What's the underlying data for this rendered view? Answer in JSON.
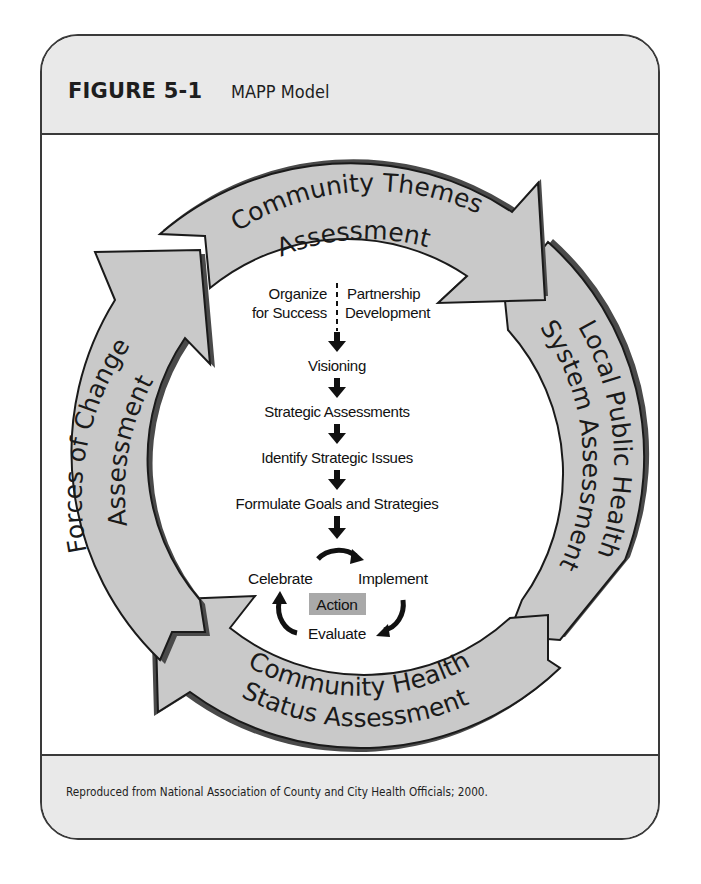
{
  "header": {
    "figure_number": "FIGURE 5-1",
    "figure_title": "MAPP Model"
  },
  "ring": {
    "top": {
      "line1": "Community Themes",
      "line2": "Assessment"
    },
    "right": {
      "line1": "Local Public Health",
      "line2": "System Assessment"
    },
    "bottom": {
      "line1": "Community Health",
      "line2": "Status Assessment"
    },
    "left": {
      "line1": "Forces of Change",
      "line2": "Assessment"
    }
  },
  "flow": {
    "organize_line1": "Organize",
    "organize_line2": "for Success",
    "partnership_line1": "Partnership",
    "partnership_line2": "Development",
    "steps": [
      "Visioning",
      "Strategic Assessments",
      "Identify Strategic Issues",
      "Formulate Goals and Strategies"
    ]
  },
  "action_cycle": {
    "center": "Action",
    "implement": "Implement",
    "evaluate": "Evaluate",
    "celebrate": "Celebrate"
  },
  "footer": {
    "credit": "Reproduced from National Association of County and City Health Officials; 2000."
  },
  "colors": {
    "arrow_fill": "#c9c9c9",
    "arrow_stroke": "#1a1a1a",
    "arrow_shadow": "#4a4a4a",
    "panel_bg": "#e9e9e9",
    "action_bg": "#a9a9a9"
  }
}
